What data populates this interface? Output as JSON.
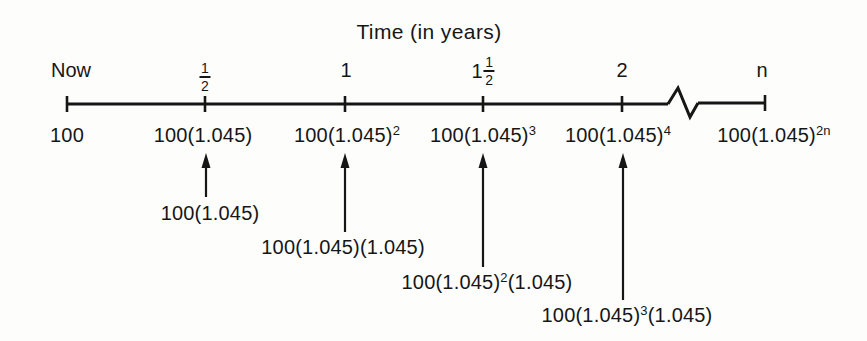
{
  "figure": {
    "title": "Time (in years)"
  },
  "timeline": {
    "axis_break": "zigzag break between 2 and n",
    "ticks": [
      {
        "label": "Now",
        "below_base": "100",
        "below_sup": ""
      },
      {
        "label": "1/2",
        "frac_num": "1",
        "frac_den": "2",
        "below_base": "100(1.045)",
        "below_sup": ""
      },
      {
        "label": "1",
        "below_base": "100(1.045)",
        "below_sup": "2"
      },
      {
        "label": "1 1/2",
        "int_part": "1",
        "frac_num": "1",
        "frac_den": "2",
        "below_base": "100(1.045)",
        "below_sup": "3"
      },
      {
        "label": "2",
        "below_base": "100(1.045)",
        "below_sup": "4"
      },
      {
        "label": "n",
        "below_base": "100(1.045)",
        "below_sup": "2n"
      }
    ]
  },
  "annotations": [
    {
      "points_to": "1/2",
      "pre": "100(1.045)",
      "sup": "",
      "post": ""
    },
    {
      "points_to": "1",
      "pre": "100(1.045)(1.045)",
      "sup": "",
      "post": ""
    },
    {
      "points_to": "1 1/2",
      "pre": "100(1.045)",
      "sup": "2",
      "post": "(1.045)"
    },
    {
      "points_to": "2",
      "pre": "100(1.045)",
      "sup": "3",
      "post": "(1.045)"
    }
  ],
  "colors": {
    "ink": "#161616",
    "background": "#fdfdfc"
  }
}
